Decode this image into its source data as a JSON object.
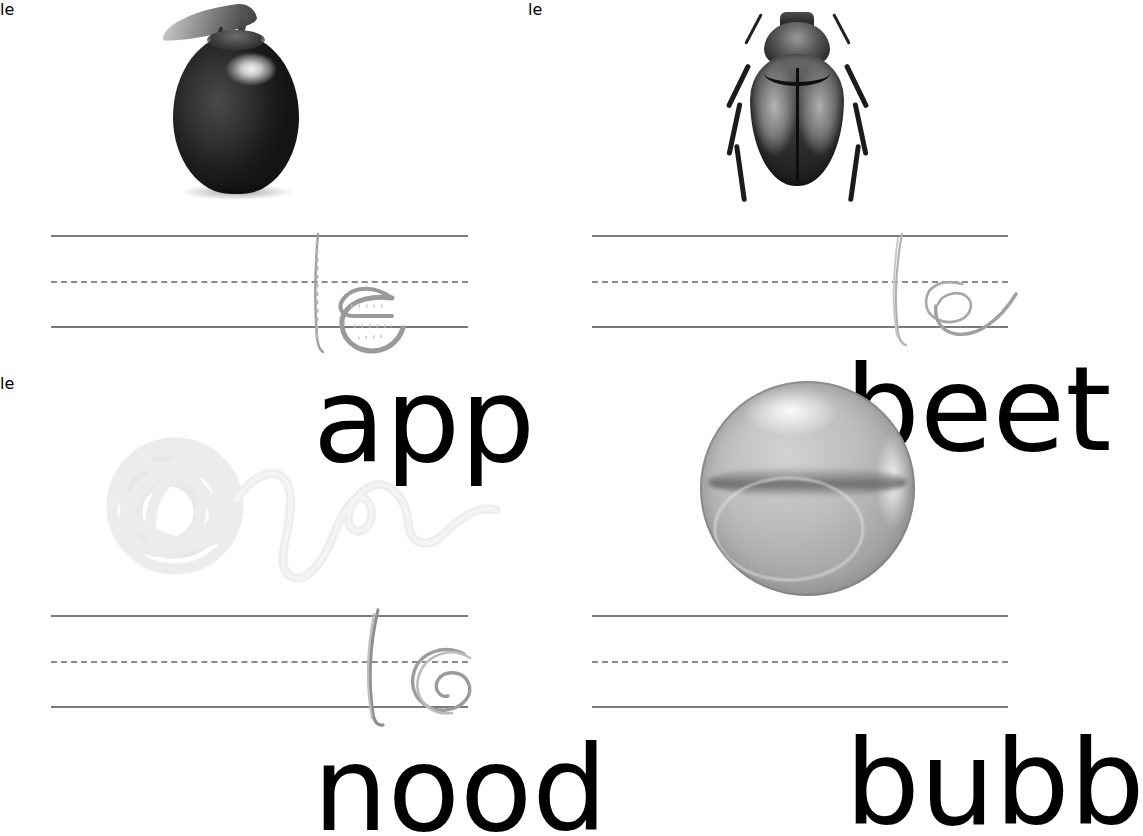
{
  "worksheet": {
    "title": "Handwriting Practice Worksheet",
    "description": "Four picture-and-word handwriting tracing exercises on three-ruled lines",
    "background_color": "#ffffff",
    "rule_color": "#7a7a7a",
    "solid_letter_color": "#000000",
    "trace_letter_color": "#b9b9b9"
  },
  "exercises": [
    {
      "id": "apple",
      "word": "apple",
      "word_solid": "app",
      "word_trace": "le",
      "picture": "apple-photo",
      "picture_label": "dark red apple with leaf and stem",
      "position": "top-left"
    },
    {
      "id": "beetle",
      "word": "beetle",
      "word_solid": "beet",
      "word_trace": "le",
      "picture": "beetle-photo",
      "picture_label": "scarab beetle seen from above",
      "position": "top-right"
    },
    {
      "id": "noodle",
      "word": "noodle",
      "word_solid": "nood",
      "word_trace": "le",
      "picture": "noodle-photo",
      "picture_label": "tangled ball of noodle with trailing strand",
      "position": "bottom-left"
    },
    {
      "id": "bubble",
      "word": "bubble",
      "word_solid": "bubb",
      "word_trace": "",
      "picture": "bubble-photo",
      "picture_label": "soap bubble sphere",
      "position": "bottom-right"
    }
  ]
}
